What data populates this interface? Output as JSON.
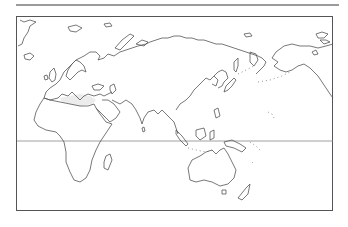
{
  "map": {
    "type": "blank outline world map",
    "projection_center": "Eurasia / Africa / Australia",
    "regions_shown": [
      "Europe",
      "Africa",
      "Asia",
      "Australia",
      "New Zealand",
      "Alaska",
      "Greenland (partial)",
      "Pacific islands"
    ],
    "reference_lines": [
      "equator"
    ],
    "labels": [],
    "colors": {
      "outline": "#555555",
      "background": "#ffffff",
      "frame": "#555555",
      "top_rule": "#9a9a9a"
    }
  }
}
